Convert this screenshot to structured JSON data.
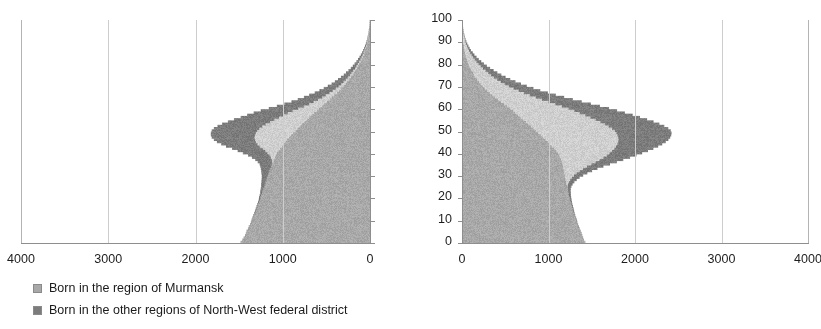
{
  "chart_data": {
    "type": "bar",
    "title": "",
    "subtitle": "",
    "orientation": "horizontal",
    "layout": "back-to-back population pyramid",
    "panels": [
      {
        "name": "males",
        "side": "left",
        "direction": "right-to-left",
        "xlabel": "",
        "ylabel": "",
        "xlim": [
          0,
          4000
        ],
        "ylim": [
          0,
          100
        ],
        "xticks": [
          4000,
          3000,
          2000,
          1000,
          0
        ],
        "xticklabels": [
          "4000",
          "3000",
          "2000",
          "1000",
          "0"
        ],
        "yticks": [
          0,
          10,
          20,
          30,
          40,
          50,
          60,
          70,
          80,
          90,
          100
        ],
        "yticklabels": [
          "",
          "",
          "",
          "",
          "",
          "",
          "",
          "",
          "",
          "",
          ""
        ],
        "show_yticklabels": false,
        "grid": "vertical"
      },
      {
        "name": "females",
        "side": "right",
        "direction": "left-to-right",
        "xlabel": "",
        "ylabel": "",
        "xlim": [
          0,
          4000
        ],
        "ylim": [
          0,
          100
        ],
        "xticks": [
          0,
          1000,
          2000,
          3000,
          4000
        ],
        "xticklabels": [
          "0",
          "1000",
          "2000",
          "3000",
          "4000"
        ],
        "yticks": [
          0,
          10,
          20,
          30,
          40,
          50,
          60,
          70,
          80,
          90,
          100
        ],
        "yticklabels": [
          "0",
          "10",
          "20",
          "30",
          "40",
          "50",
          "60",
          "70",
          "80",
          "90",
          "100"
        ],
        "show_yticklabels": true,
        "grid": "vertical"
      }
    ],
    "legend": {
      "position": "below",
      "entries": [
        {
          "label": "Born in the region of Murmansk",
          "color": "#a8a8a8"
        },
        {
          "label": "Born in the other regions of North-West federal district",
          "color": "#7c7c7c"
        }
      ]
    },
    "series": [
      {
        "name": "Born in the region of Murmansk",
        "color": "#a8a8a8",
        "stack_order": 1
      },
      {
        "name": "Middle band",
        "color": "#cfcfcf",
        "stack_order": 2
      },
      {
        "name": "Born in the other regions of North-West federal district",
        "color": "#7c7c7c",
        "stack_order": 3
      }
    ],
    "ages": [
      0,
      1,
      2,
      3,
      4,
      5,
      6,
      7,
      8,
      9,
      10,
      11,
      12,
      13,
      14,
      15,
      16,
      17,
      18,
      19,
      20,
      21,
      22,
      23,
      24,
      25,
      26,
      27,
      28,
      29,
      30,
      31,
      32,
      33,
      34,
      35,
      36,
      37,
      38,
      39,
      40,
      41,
      42,
      43,
      44,
      45,
      46,
      47,
      48,
      49,
      50,
      51,
      52,
      53,
      54,
      55,
      56,
      57,
      58,
      59,
      60,
      61,
      62,
      63,
      64,
      65,
      66,
      67,
      68,
      69,
      70,
      71,
      72,
      73,
      74,
      75,
      76,
      77,
      78,
      79,
      80,
      81,
      82,
      83,
      84,
      85,
      86,
      87,
      88,
      89,
      90,
      91,
      92,
      93,
      94,
      95,
      96,
      97,
      98,
      99,
      100
    ],
    "males": {
      "Born in the region of Murmansk": [
        1490,
        1470,
        1455,
        1440,
        1430,
        1420,
        1405,
        1395,
        1380,
        1370,
        1360,
        1350,
        1340,
        1330,
        1320,
        1310,
        1300,
        1290,
        1280,
        1270,
        1265,
        1255,
        1245,
        1240,
        1230,
        1220,
        1215,
        1205,
        1195,
        1185,
        1175,
        1170,
        1160,
        1150,
        1140,
        1130,
        1120,
        1110,
        1100,
        1090,
        1080,
        1060,
        1040,
        1020,
        1000,
        980,
        960,
        940,
        915,
        890,
        865,
        840,
        815,
        790,
        760,
        735,
        705,
        680,
        650,
        620,
        590,
        560,
        530,
        500,
        470,
        440,
        415,
        385,
        360,
        335,
        310,
        285,
        265,
        245,
        225,
        205,
        190,
        172,
        155,
        140,
        126,
        112,
        100,
        88,
        77,
        67,
        58,
        50,
        42,
        36,
        30,
        25,
        21,
        17,
        14,
        11,
        9,
        7,
        5,
        4,
        3,
        2
      ],
      "Middle band": [
        0,
        0,
        0,
        0,
        0,
        0,
        0,
        0,
        0,
        0,
        0,
        0,
        0,
        0,
        0,
        0,
        0,
        0,
        0,
        0,
        0,
        0,
        0,
        0,
        0,
        0,
        0,
        0,
        0,
        0,
        0,
        0,
        0,
        0,
        0,
        0,
        10,
        25,
        45,
        70,
        105,
        150,
        200,
        255,
        300,
        340,
        370,
        395,
        415,
        430,
        440,
        440,
        430,
        415,
        395,
        370,
        345,
        320,
        300,
        275,
        240,
        205,
        175,
        150,
        130,
        112,
        96,
        82,
        70,
        60,
        52,
        46,
        40,
        35,
        31,
        27,
        24,
        21,
        18,
        16,
        14,
        12,
        10,
        9,
        8,
        7,
        6,
        5,
        4,
        3,
        3,
        2,
        2,
        1,
        1,
        1,
        0,
        0,
        0,
        0,
        0
      ],
      "Born in the other regions of North-West federal district": [
        5,
        5,
        5,
        5,
        5,
        6,
        6,
        6,
        7,
        7,
        8,
        8,
        9,
        9,
        10,
        11,
        12,
        13,
        14,
        16,
        18,
        21,
        24,
        28,
        33,
        38,
        44,
        50,
        58,
        66,
        76,
        86,
        98,
        112,
        128,
        146,
        168,
        192,
        220,
        250,
        285,
        320,
        355,
        390,
        420,
        450,
        475,
        495,
        510,
        520,
        525,
        525,
        518,
        505,
        488,
        468,
        445,
        420,
        395,
        368,
        340,
        312,
        285,
        258,
        235,
        212,
        192,
        172,
        155,
        140,
        126,
        113,
        101,
        90,
        80,
        71,
        63,
        56,
        49,
        43,
        38,
        33,
        29,
        25,
        21,
        18,
        15,
        13,
        11,
        9,
        7,
        6,
        5,
        4,
        3,
        2,
        2,
        1,
        1,
        1,
        0
      ]
    },
    "females": {
      "Born in the region of Murmansk": [
        1420,
        1405,
        1395,
        1385,
        1375,
        1365,
        1355,
        1345,
        1335,
        1325,
        1318,
        1310,
        1300,
        1292,
        1285,
        1278,
        1270,
        1262,
        1255,
        1248,
        1242,
        1236,
        1230,
        1225,
        1220,
        1215,
        1210,
        1205,
        1200,
        1195,
        1190,
        1185,
        1180,
        1175,
        1170,
        1165,
        1160,
        1150,
        1140,
        1130,
        1115,
        1095,
        1070,
        1045,
        1020,
        995,
        968,
        940,
        912,
        885,
        858,
        830,
        800,
        770,
        740,
        710,
        680,
        650,
        620,
        590,
        560,
        525,
        490,
        455,
        420,
        388,
        355,
        325,
        295,
        268,
        242,
        218,
        196,
        176,
        158,
        142,
        127,
        113,
        100,
        88,
        78,
        68,
        59,
        51,
        44,
        38,
        32,
        27,
        23,
        19,
        16,
        13,
        11,
        9,
        7,
        5,
        4,
        3,
        2,
        2,
        1,
        1
      ],
      "Middle band": [
        0,
        0,
        0,
        0,
        0,
        0,
        0,
        0,
        0,
        0,
        0,
        0,
        0,
        0,
        0,
        0,
        0,
        0,
        0,
        0,
        0,
        0,
        0,
        0,
        0,
        5,
        15,
        30,
        50,
        75,
        105,
        140,
        180,
        225,
        275,
        330,
        385,
        440,
        495,
        545,
        590,
        640,
        690,
        735,
        775,
        810,
        840,
        865,
        885,
        900,
        908,
        905,
        895,
        880,
        860,
        835,
        805,
        775,
        742,
        708,
        672,
        630,
        588,
        545,
        505,
        465,
        428,
        392,
        358,
        328,
        300,
        275,
        252,
        230,
        210,
        192,
        175,
        158,
        142,
        127,
        113,
        100,
        88,
        77,
        66,
        57,
        48,
        41,
        34,
        28,
        23,
        19,
        15,
        12,
        10,
        8,
        6,
        5,
        4,
        3,
        2
      ],
      "Born in the other regions of North-West federal district": [
        5,
        5,
        5,
        5,
        6,
        6,
        6,
        7,
        7,
        8,
        8,
        9,
        9,
        10,
        11,
        12,
        13,
        14,
        16,
        18,
        20,
        23,
        27,
        32,
        38,
        45,
        54,
        64,
        76,
        90,
        106,
        124,
        144,
        166,
        190,
        216,
        245,
        275,
        308,
        342,
        378,
        415,
        452,
        488,
        520,
        550,
        578,
        602,
        622,
        638,
        648,
        650,
        644,
        632,
        615,
        595,
        572,
        548,
        522,
        495,
        468,
        440,
        412,
        384,
        356,
        328,
        302,
        276,
        252,
        230,
        208,
        188,
        170,
        152,
        136,
        121,
        107,
        95,
        83,
        73,
        63,
        55,
        47,
        40,
        34,
        29,
        24,
        20,
        17,
        14,
        11,
        9,
        7,
        6,
        5,
        4,
        3,
        2,
        2,
        1,
        1
      ]
    }
  },
  "axes": {
    "left": {
      "xticklabels": [
        "4000",
        "3000",
        "2000",
        "1000",
        "0"
      ]
    },
    "right": {
      "xticklabels": [
        "0",
        "1000",
        "2000",
        "3000",
        "4000"
      ],
      "yticklabels": [
        "100",
        "90",
        "80",
        "70",
        "60",
        "50",
        "40",
        "30",
        "20",
        "10",
        "0"
      ]
    }
  },
  "legend": {
    "items": [
      {
        "label": "Born in the region of Murmansk",
        "color": "#a8a8a8"
      },
      {
        "label": "Born in the other regions of North-West federal district",
        "color": "#7c7c7c"
      }
    ]
  }
}
